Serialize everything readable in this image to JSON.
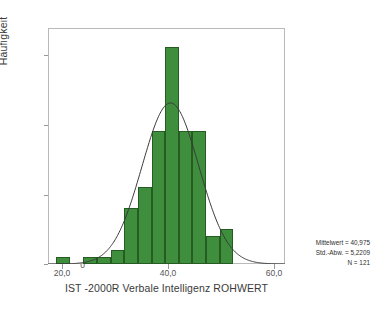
{
  "chart_data": {
    "type": "bar",
    "title": "",
    "xlabel": "IST -2000R Verbale Intelligenz ROHWERT",
    "ylabel": "Häufigkeit",
    "xlim": [
      18.5,
      62.0
    ],
    "ylim": [
      0,
      33.7
    ],
    "grid": false,
    "legend": null,
    "bin_width": 2.5,
    "x_ticks": [
      {
        "value": 20.0,
        "label": "20,0"
      },
      {
        "value": 40.0,
        "label": "40,0"
      },
      {
        "value": 60.0,
        "label": "60,0"
      }
    ],
    "y_ticks": [
      {
        "value": 0,
        "label": "0"
      },
      {
        "value": 10,
        "label": "10"
      },
      {
        "value": 20,
        "label": "20"
      },
      {
        "value": 30,
        "label": "30"
      }
    ],
    "bins": [
      {
        "x_start": 20.0,
        "x_end": 22.5,
        "value": 1
      },
      {
        "x_start": 22.5,
        "x_end": 25.0,
        "value": 0
      },
      {
        "x_start": 25.0,
        "x_end": 27.5,
        "value": 1
      },
      {
        "x_start": 27.5,
        "x_end": 30.0,
        "value": 1
      },
      {
        "x_start": 30.0,
        "x_end": 32.5,
        "value": 2
      },
      {
        "x_start": 32.5,
        "x_end": 35.0,
        "value": 8
      },
      {
        "x_start": 35.0,
        "x_end": 37.5,
        "value": 11
      },
      {
        "x_start": 37.5,
        "x_end": 40.0,
        "value": 19
      },
      {
        "x_start": 40.0,
        "x_end": 42.5,
        "value": 31
      },
      {
        "x_start": 42.5,
        "x_end": 45.0,
        "value": 19
      },
      {
        "x_start": 45.0,
        "x_end": 47.5,
        "value": 19
      },
      {
        "x_start": 47.5,
        "x_end": 50.0,
        "value": 4
      },
      {
        "x_start": 50.0,
        "x_end": 52.5,
        "value": 5
      }
    ],
    "values": [
      1,
      0,
      1,
      1,
      2,
      8,
      11,
      19,
      31,
      19,
      19,
      4,
      5
    ],
    "categories": [
      "20,0-22,5",
      "22,5-25,0",
      "25,0-27,5",
      "27,5-30,0",
      "30,0-32,5",
      "32,5-35,0",
      "35,0-37,5",
      "37,5-40,0",
      "40,0-42,5",
      "42,5-45,0",
      "45,0-47,5",
      "47,5-50,0",
      "50,0-52,5"
    ],
    "normal_curve": {
      "mean": 40.975,
      "std": 5.2209,
      "n": 121,
      "peak_value": 23.0
    },
    "colors": {
      "bar_fill": "#3E8E3E",
      "bar_edge": "#245c22",
      "curve": "#3a3a3a",
      "frame": "#b9b9b9",
      "text": "#3a3a3a"
    }
  },
  "stats_box": {
    "mean_line": "Mittelwert = 40,975",
    "std_line": "Std.-Abw. = 5,2209",
    "n_line": "N = 121"
  }
}
